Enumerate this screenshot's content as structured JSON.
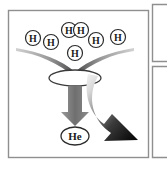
{
  "figure": {
    "name": "hydrogen-fusion-to-helium-diagram",
    "background_color": "#ffffff",
    "frame": {
      "name": "main-panel-frame",
      "border_color": "#8f8f8f",
      "x": 8,
      "y": 10,
      "width": 141,
      "height": 148
    },
    "side_panels": [
      {
        "name": "side-panel-top",
        "border_color": "#8f8f8f",
        "x": 152,
        "y": 4,
        "width": 30,
        "height": 58
      },
      {
        "name": "side-panel-bottom",
        "border_color": "#8f8f8f",
        "x": 152,
        "y": 66,
        "width": 30,
        "height": 92
      }
    ]
  },
  "atoms": {
    "reactants": [
      {
        "id": "h1",
        "label": "H",
        "cx": 33,
        "cy": 38,
        "r": 7.5
      },
      {
        "id": "h2",
        "label": "H",
        "cx": 51,
        "cy": 42,
        "r": 7.5
      },
      {
        "id": "h3",
        "label": "H",
        "cx": 69,
        "cy": 30,
        "r": 7.5
      },
      {
        "id": "h4",
        "label": "H",
        "cx": 81,
        "cy": 30,
        "r": 7.5
      },
      {
        "id": "h5",
        "label": "H",
        "cx": 96,
        "cy": 40,
        "r": 7.5
      },
      {
        "id": "h6",
        "label": "H",
        "cx": 118,
        "cy": 37,
        "r": 7.5
      },
      {
        "id": "h7",
        "label": "H",
        "cx": 75,
        "cy": 53,
        "r": 7.5
      }
    ],
    "product": {
      "id": "he1",
      "label": "He",
      "cx": 75,
      "cy": 136,
      "rx": 14,
      "ry": 9
    }
  },
  "shapes": {
    "funnel": {
      "name": "fusion-funnel",
      "gradient_from": "#cfcfcf",
      "gradient_to": "#585858"
    },
    "core_ellipse": {
      "name": "fusion-core-ellipse",
      "cx": 75,
      "cy": 78,
      "rx": 26,
      "ry": 8,
      "stroke": "#3a3a3a",
      "fill": "#ffffff"
    },
    "down_arrow": {
      "name": "matter-output-arrow",
      "color": "#7b7b7b",
      "direction": "down"
    },
    "curved_arrow": {
      "name": "energy-output-curved-arrow",
      "gradient_from": "#e8e8e8",
      "gradient_to": "#0d0d0d",
      "direction": "down-right"
    }
  },
  "colors": {
    "ink": "#1b1b1b",
    "frame": "#8f8f8f",
    "gray_arrow": "#7b7b7b",
    "black_arrow": "#0d0d0d"
  }
}
